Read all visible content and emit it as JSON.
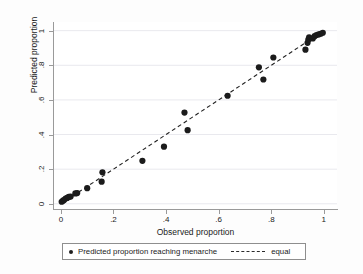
{
  "figure": {
    "background_color": "#fdfdfd",
    "plot_background_color": "#ffffff"
  },
  "axes": {
    "x": {
      "title": "Observed proportion",
      "ticks": [
        "0",
        ".2",
        ".4",
        ".6",
        ".8",
        "1"
      ],
      "tick_values": [
        0,
        0.2,
        0.4,
        0.6,
        0.8,
        1
      ],
      "range": [
        -0.03,
        1.05
      ]
    },
    "y": {
      "title": "Predicted proportion",
      "ticks": [
        "0",
        ".2",
        ".4",
        ".6",
        ".8",
        "1"
      ],
      "tick_values": [
        0,
        0.2,
        0.4,
        0.6,
        0.8,
        1
      ],
      "range": [
        -0.03,
        1.05
      ]
    }
  },
  "legend": {
    "entries": [
      {
        "label": "Predicted proportion reaching menarche",
        "marker": "filled-circle",
        "color": "#1b1b1b"
      },
      {
        "label": "equal",
        "marker": "dashed-line",
        "color": "#222222"
      }
    ]
  },
  "chart_data": {
    "type": "scatter",
    "title": "",
    "subtitle": "",
    "xlabel": "Observed proportion",
    "ylabel": "Predicted proportion",
    "xlim": [
      -0.03,
      1.05
    ],
    "ylim": [
      -0.03,
      1.05
    ],
    "xticks": [
      0,
      0.2,
      0.4,
      0.6,
      0.8,
      1
    ],
    "yticks": [
      0,
      0.2,
      0.4,
      0.6,
      0.8,
      1
    ],
    "xtick_labels": [
      "0",
      ".2",
      ".4",
      ".6",
      ".8",
      "1"
    ],
    "ytick_labels": [
      "0",
      ".2",
      ".4",
      ".6",
      ".8",
      "1"
    ],
    "grid": "horizontal",
    "legend_position": "below-plot",
    "marker_color": "#1b1b1b",
    "marker_size": 3.1,
    "series": [
      {
        "name": "Predicted proportion reaching menarche",
        "type": "scatter",
        "marker": "filled-circle",
        "points": [
          [
            0.003,
            0.012
          ],
          [
            0.008,
            0.018
          ],
          [
            0.012,
            0.022
          ],
          [
            0.018,
            0.03
          ],
          [
            0.024,
            0.034
          ],
          [
            0.03,
            0.04
          ],
          [
            0.037,
            0.042
          ],
          [
            0.055,
            0.06
          ],
          [
            0.062,
            0.062
          ],
          [
            0.1,
            0.09
          ],
          [
            0.155,
            0.128
          ],
          [
            0.158,
            0.182
          ],
          [
            0.31,
            0.248
          ],
          [
            0.392,
            0.33
          ],
          [
            0.47,
            0.527
          ],
          [
            0.482,
            0.425
          ],
          [
            0.634,
            0.624
          ],
          [
            0.753,
            0.788
          ],
          [
            0.77,
            0.718
          ],
          [
            0.808,
            0.845
          ],
          [
            0.93,
            0.89
          ],
          [
            0.938,
            0.93
          ],
          [
            0.941,
            0.948
          ],
          [
            0.944,
            0.962
          ],
          [
            0.958,
            0.955
          ],
          [
            0.965,
            0.968
          ],
          [
            0.972,
            0.975
          ],
          [
            0.98,
            0.978
          ],
          [
            0.988,
            0.982
          ],
          [
            0.996,
            0.988
          ]
        ]
      },
      {
        "name": "equal",
        "type": "line",
        "style": "dashed",
        "points": [
          [
            0.0,
            0.0
          ],
          [
            1.0,
            1.0
          ]
        ]
      }
    ]
  }
}
